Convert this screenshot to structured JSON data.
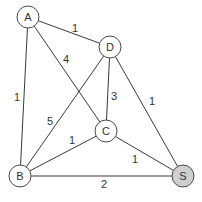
{
  "graph": {
    "nodes": [
      {
        "id": "A",
        "label": "A",
        "x": 28,
        "y": 17,
        "fill": "#ffffff"
      },
      {
        "id": "D",
        "label": "D",
        "x": 110,
        "y": 47,
        "fill": "#ffffff"
      },
      {
        "id": "C",
        "label": "C",
        "x": 106,
        "y": 131,
        "fill": "#ffffff"
      },
      {
        "id": "B",
        "label": "B",
        "x": 20,
        "y": 176,
        "fill": "#ffffff"
      },
      {
        "id": "S",
        "label": "S",
        "x": 183,
        "y": 176,
        "fill": "#cfcfcf"
      }
    ],
    "edges": [
      {
        "from": "A",
        "to": "D",
        "weight": "1",
        "lx": 75,
        "ly": 28
      },
      {
        "from": "A",
        "to": "C",
        "weight": "4",
        "lx": 66,
        "ly": 59
      },
      {
        "from": "A",
        "to": "B",
        "weight": "1",
        "lx": 17,
        "ly": 97
      },
      {
        "from": "D",
        "to": "C",
        "weight": "3",
        "lx": 114,
        "ly": 96
      },
      {
        "from": "D",
        "to": "S",
        "weight": "1",
        "lx": 152,
        "ly": 101
      },
      {
        "from": "D",
        "to": "B",
        "weight": "5",
        "lx": 50,
        "ly": 121
      },
      {
        "from": "C",
        "to": "B",
        "weight": "1",
        "lx": 72,
        "ly": 140
      },
      {
        "from": "C",
        "to": "S",
        "weight": "1",
        "lx": 135,
        "ly": 159
      },
      {
        "from": "B",
        "to": "S",
        "weight": "2",
        "lx": 104,
        "ly": 184
      }
    ]
  }
}
